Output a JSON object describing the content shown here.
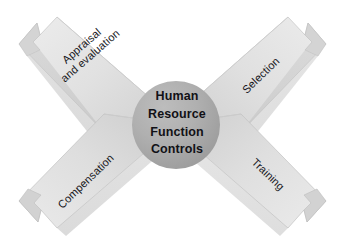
{
  "diagram": {
    "title": "Human Resource Function Controls",
    "background_color": "#ffffff",
    "center": {
      "name": "hub",
      "lines": [
        "Human",
        "Resource",
        "Function",
        "Controls"
      ],
      "shape": "circle",
      "fill_color": "#a9a9a9",
      "text_color": "#111116"
    },
    "arrows": [
      {
        "id": "appraisal",
        "label": "Appraisal\nand evaluation",
        "label_lines": [
          "Appraisal",
          "and evaluation"
        ],
        "direction": "up-left",
        "fill_color": "#e2e2e2",
        "edge_color": "#b9b9b9"
      },
      {
        "id": "selection",
        "label": "Selection",
        "label_lines": [
          "Selection"
        ],
        "direction": "up-right",
        "fill_color": "#e2e2e2",
        "edge_color": "#b9b9b9"
      },
      {
        "id": "compensation",
        "label": "Compensation",
        "label_lines": [
          "Compensation"
        ],
        "direction": "down-left",
        "fill_color": "#e2e2e2",
        "edge_color": "#b9b9b9"
      },
      {
        "id": "training",
        "label": "Training",
        "label_lines": [
          "Training"
        ],
        "direction": "down-right",
        "fill_color": "#e2e2e2",
        "edge_color": "#b9b9b9"
      }
    ]
  }
}
